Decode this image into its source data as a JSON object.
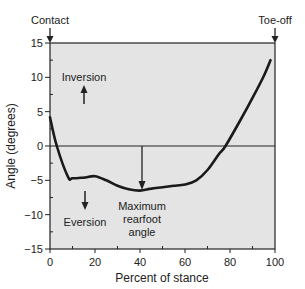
{
  "chart_data": {
    "type": "line",
    "title": "",
    "xlabel": "Percent of stance",
    "ylabel": "Angle (degrees)",
    "xlim": [
      0,
      100
    ],
    "ylim": [
      -15,
      15
    ],
    "xticks": [
      0,
      20,
      40,
      60,
      80,
      100
    ],
    "yticks": [
      15,
      10,
      5,
      0,
      -5,
      -10,
      -15
    ],
    "grid": false,
    "legend": null,
    "series": [
      {
        "name": "Rearfoot angle",
        "x": [
          0,
          3,
          8,
          10,
          15,
          20,
          25,
          30,
          35,
          40,
          45,
          50,
          55,
          60,
          65,
          70,
          75,
          78,
          85,
          90,
          95,
          98
        ],
        "y": [
          4.2,
          0,
          -4.5,
          -4.7,
          -4.6,
          -4.4,
          -5.0,
          -5.8,
          -6.3,
          -6.5,
          -6.2,
          -6.0,
          -5.8,
          -5.6,
          -5.0,
          -3.5,
          -1.2,
          0,
          4.0,
          7.0,
          10.2,
          12.5
        ]
      }
    ],
    "annotations": [
      {
        "text": "Contact",
        "x": 0,
        "position": "top"
      },
      {
        "text": "Toe-off",
        "x": 100,
        "position": "top"
      },
      {
        "text": "Inversion",
        "arrow": "up"
      },
      {
        "text": "Eversion",
        "arrow": "down"
      },
      {
        "text": "Maximum rearfoot angle",
        "x": 40,
        "y": -6.5
      }
    ]
  },
  "labels": {
    "contact": "Contact",
    "toe_off": "Toe-off",
    "inversion": "Inversion",
    "eversion": "Eversion",
    "max_line1": "Maximum",
    "max_line2": "rearfoot",
    "max_line3": "angle",
    "xlabel": "Percent of stance",
    "ylabel": "Angle (degrees)"
  },
  "colors": {
    "plot_bg": "#e4e4e4",
    "line": "#1a1a1a"
  }
}
